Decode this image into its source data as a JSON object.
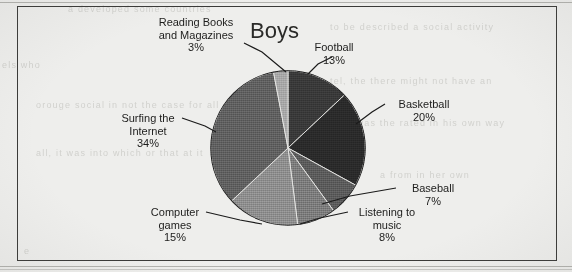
{
  "chart_data": {
    "type": "pie",
    "title": "Boys",
    "xlabel": "",
    "ylabel": "",
    "legend_position": "none",
    "grid": false,
    "unit": "%",
    "categories": [
      "Football",
      "Basketball",
      "Baseball",
      "Listening to music",
      "Computer games",
      "Surfing the Internet",
      "Reading Books and Magazines"
    ],
    "values": [
      13,
      20,
      7,
      8,
      15,
      34,
      3
    ],
    "slices": [
      {
        "name": "Football",
        "value": 13,
        "value_label": "13%",
        "label_line1": "Football",
        "label_line2": "13%",
        "color": "#3a3a3a",
        "start_angle": 0,
        "end_angle": 46.8
      },
      {
        "name": "Basketball",
        "value": 20,
        "value_label": "20%",
        "label_line1": "Basketball",
        "label_line2": "20%",
        "color": "#2b2b2b",
        "start_angle": 46.8,
        "end_angle": 118.8
      },
      {
        "name": "Baseball",
        "value": 7,
        "value_label": "7%",
        "label_line1": "Baseball",
        "label_line2": "7%",
        "color": "#5c5c5c",
        "start_angle": 118.8,
        "end_angle": 144.0
      },
      {
        "name": "Listening to music",
        "value": 8,
        "value_label": "8%",
        "label_line1": "Listening to",
        "label_line2": "music",
        "label_line3": "8%",
        "color": "#7d7d7d",
        "start_angle": 144.0,
        "end_angle": 172.8
      },
      {
        "name": "Computer games",
        "value": 15,
        "value_label": "15%",
        "label_line1": "Computer",
        "label_line2": "games",
        "label_line3": "15%",
        "color": "#8f8f8f",
        "start_angle": 172.8,
        "end_angle": 226.8
      },
      {
        "name": "Surfing the Internet",
        "value": 34,
        "value_label": "34%",
        "label_line1": "Surfing the",
        "label_line2": "Internet",
        "label_line3": "34%",
        "color": "#616161",
        "start_angle": 226.8,
        "end_angle": 349.2
      },
      {
        "name": "Reading Books and Magazines",
        "value": 3,
        "value_label": "3%",
        "label_line1": "Reading Books",
        "label_line2": "and Magazines",
        "label_line3": "3%",
        "color": "#a8a8a8",
        "start_angle": 349.2,
        "end_angle": 360
      }
    ]
  },
  "ghost_text": {
    "line1": "a    developed  some   countries",
    "line2": "to  be  described  a  social  activity",
    "line3": "els       who",
    "line4": "tel,  the  there  might  not  have  an",
    "line5": "orouge  social  in  not  the  case  for  all",
    "line6": "here  was  the  rated  in  his  own  way",
    "line7": "all,  it  was  into  which  or  that  at  it",
    "line8": "a  from  in  her  own",
    "line9": "e"
  }
}
